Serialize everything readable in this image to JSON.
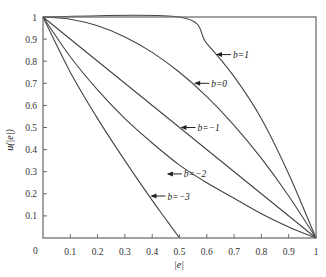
{
  "chart_data": {
    "type": "line",
    "title": "",
    "xlabel": "|e|",
    "ylabel": "u(|e|)",
    "xlim": [
      0,
      1
    ],
    "ylim": [
      0,
      1
    ],
    "grid": false,
    "legend_position": "inline-annotations",
    "x_ticks": [
      "0.1",
      "0.2",
      "0.3",
      "0.4",
      "0.5",
      "0.6",
      "0.7",
      "0.8",
      "0.9",
      "1"
    ],
    "y_ticks": [
      "0.1",
      "0.2",
      "0.3",
      "0.4",
      "0.5",
      "0.6",
      "0.7",
      "0.8",
      "0.9",
      "1"
    ],
    "origin_label": "0",
    "series": [
      {
        "name": "b=1",
        "label": "b=1",
        "x": [
          0,
          0.5,
          0.6,
          0.7,
          0.8,
          0.9,
          1.0
        ],
        "y": [
          1,
          1,
          0.88,
          0.73,
          0.54,
          0.29,
          0
        ],
        "label_at": [
          0.63,
          0.83
        ]
      },
      {
        "name": "b=0",
        "label": "b=0",
        "x": [
          0,
          0.1,
          0.2,
          0.3,
          0.4,
          0.5,
          0.6,
          0.7,
          0.8,
          0.9,
          1.0
        ],
        "y": [
          1,
          0.99,
          0.96,
          0.91,
          0.84,
          0.75,
          0.64,
          0.51,
          0.36,
          0.19,
          0
        ],
        "label_at": [
          0.55,
          0.7
        ]
      },
      {
        "name": "b=-1",
        "label": "b=−1",
        "x": [
          0,
          1
        ],
        "y": [
          1,
          0
        ],
        "label_at": [
          0.5,
          0.5
        ]
      },
      {
        "name": "b=-2",
        "label": "b=−2",
        "x": [
          0,
          0.1,
          0.2,
          0.3,
          0.4,
          0.5,
          0.6,
          0.7,
          0.8,
          0.9,
          1.0
        ],
        "y": [
          1,
          0.82,
          0.67,
          0.54,
          0.43,
          0.33,
          0.25,
          0.18,
          0.11,
          0.05,
          0
        ],
        "label_at": [
          0.45,
          0.29
        ]
      },
      {
        "name": "b=-3",
        "label": "b=−3",
        "x": [
          0,
          0.1,
          0.2,
          0.3,
          0.4,
          0.45,
          0.5
        ],
        "y": [
          1,
          0.75,
          0.54,
          0.35,
          0.17,
          0.085,
          0
        ],
        "label_at": [
          0.39,
          0.19
        ]
      }
    ]
  },
  "colors": {
    "axis": "#555555",
    "curve": "#444444",
    "text": "#222222",
    "background": "#ffffff"
  }
}
